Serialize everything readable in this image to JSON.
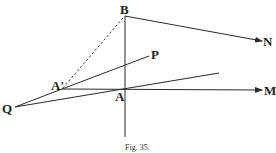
{
  "diagram": {
    "caption": "Fig. 35.",
    "points": {
      "B": {
        "label": "B",
        "x": 125,
        "y": 16
      },
      "N": {
        "label": "N",
        "x": 262,
        "y": 41
      },
      "P": {
        "label": "P",
        "x": 149,
        "y": 56
      },
      "A_prime": {
        "label": "A'",
        "x": 62,
        "y": 89
      },
      "A": {
        "label": "A",
        "x": 125,
        "y": 90
      },
      "M": {
        "label": "M",
        "x": 262,
        "y": 90
      },
      "Q": {
        "label": "Q",
        "x": 14,
        "y": 107
      }
    },
    "segments": [
      {
        "from": "B",
        "to": "N",
        "style": "arrow"
      },
      {
        "from": "B",
        "to": "A_prime",
        "style": "dashed"
      },
      {
        "from": "B",
        "to": "vertical-bottom",
        "style": "solid"
      },
      {
        "from": "A_prime",
        "to": "P",
        "style": "solid"
      },
      {
        "from": "A_prime",
        "to": "M",
        "style": "arrow"
      },
      {
        "from": "Q",
        "to": "A_prime",
        "style": "solid"
      },
      {
        "from": "Q",
        "to": "line-end",
        "style": "solid"
      }
    ]
  }
}
